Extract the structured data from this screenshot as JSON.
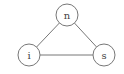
{
  "diagram": {
    "type": "undirected-graph",
    "colors": {
      "stroke": "#777777",
      "fill": "#ffffff",
      "text": "#444444"
    },
    "nodes": [
      {
        "id": "n",
        "label": "n",
        "cx": 67,
        "cy": 15,
        "r": 11
      },
      {
        "id": "i",
        "label": "i",
        "cx": 29,
        "cy": 55,
        "r": 11
      },
      {
        "id": "s",
        "label": "s",
        "cx": 104,
        "cy": 55,
        "r": 11
      }
    ],
    "edges": [
      {
        "from": "n",
        "to": "i"
      },
      {
        "from": "n",
        "to": "s"
      },
      {
        "from": "i",
        "to": "s"
      }
    ]
  }
}
